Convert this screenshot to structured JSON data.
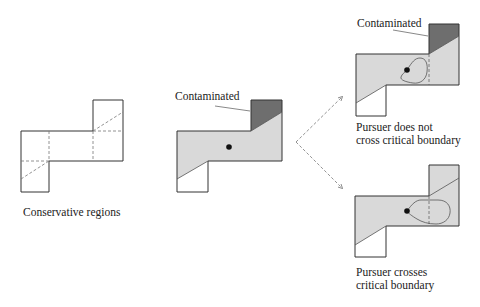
{
  "panels": {
    "conservative": {
      "caption": "Conservative regions"
    },
    "initial": {
      "label": "Contaminated"
    },
    "no_cross": {
      "label": "Contaminated",
      "caption_line1": "Pursuer does not",
      "caption_line2": "cross critical boundary"
    },
    "cross": {
      "caption_line1": "Pursuer crosses",
      "caption_line2": "critical boundary"
    }
  },
  "colors": {
    "cleared_fill": "#d9d9d9",
    "contaminated_fill": "#6e6e6e",
    "outline": "#333333",
    "dashed": "#777777"
  }
}
